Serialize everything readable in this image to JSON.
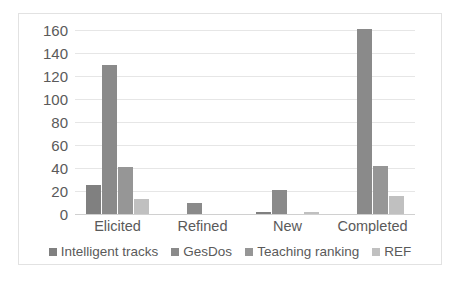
{
  "chart_data": {
    "type": "bar",
    "title": "",
    "subtitle": "",
    "xlabel": "",
    "ylabel": "",
    "categories": [
      "Elicited",
      "Refined",
      "New",
      "Completed"
    ],
    "series": [
      {
        "name": "Intelligent tracks",
        "color": "#808080",
        "values": [
          25,
          0,
          2,
          0
        ]
      },
      {
        "name": "GesDos",
        "color": "#8a8a8a",
        "values": [
          130,
          10,
          21,
          161
        ]
      },
      {
        "name": "Teaching ranking",
        "color": "#969696",
        "values": [
          41,
          0,
          0,
          42
        ]
      },
      {
        "name": "REF",
        "color": "#c0c0c0",
        "values": [
          13,
          0,
          2,
          16
        ]
      }
    ],
    "ylim": [
      0,
      160
    ],
    "yticks": [
      0,
      20,
      40,
      60,
      80,
      100,
      120,
      140,
      160
    ],
    "ytick_labels": [
      "0",
      "20",
      "40",
      "60",
      "80",
      "100",
      "120",
      "140",
      "160"
    ],
    "grid": true,
    "grid_color": "#e6e6e6",
    "legend_position": "bottom",
    "plot_background": "#ffffff",
    "border_color": "#e2e2e2",
    "text_color": "#5a5a5a"
  }
}
